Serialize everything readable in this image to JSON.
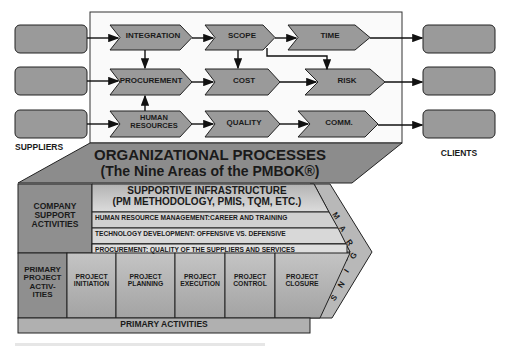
{
  "diagram": {
    "suppliers_label": "SUPPLIERS",
    "clients_label": "CLIENTS",
    "knowledge_areas": {
      "row1": [
        "INTEGRATION",
        "SCOPE",
        "TIME"
      ],
      "row2": [
        "PROCUREMENT",
        "COST",
        "RISK"
      ],
      "row3": [
        "HUMAN",
        "RESOURCES",
        "QUALITY",
        "COMM."
      ]
    },
    "org_processes": {
      "title": "ORGANIZATIONAL PROCESSES",
      "subtitle": "(The Nine Areas of the PMBOK®)"
    },
    "support": {
      "company_support": [
        "COMPANY",
        "SUPPORT",
        "ACTIVITIES"
      ],
      "infrastructure_title": "SUPPORTIVE INFRASTRUCTURE",
      "infrastructure_sub": "(PM METHODOLOGY, PMIS, TQM, ETC.)",
      "rows": [
        "HUMAN RESOURCE MANAGEMENT:CAREER AND TRAINING",
        "TECHNOLOGY DEVELOPMENT: OFFENSIVE VS. DEFENSIVE",
        "PROCUREMENT: QUALITY OF THE SUPPLIERS AND SERVICES"
      ]
    },
    "primary": {
      "row_header": [
        "PRIMARY",
        "PROJECT",
        "ACTIV-",
        "ITIES"
      ],
      "phases": [
        [
          "PROJECT",
          "INITIATION"
        ],
        [
          "PROJECT",
          "PLANNING"
        ],
        [
          "PROJECT",
          "EXECUTION"
        ],
        [
          "PROJECT",
          "CONTROL"
        ],
        [
          "PROJECT",
          "CLOSURE"
        ]
      ],
      "footer": "PRIMARY ACTIVITIES"
    },
    "margins_letters": [
      "M",
      "A",
      "R",
      "G",
      "I",
      "N",
      "S"
    ]
  },
  "colors": {
    "box_fill": "#9a9a9a",
    "dark_fill": "#8c8c8c",
    "light_fill": "#c8c8c8",
    "stroke": "#1a1a1a"
  }
}
